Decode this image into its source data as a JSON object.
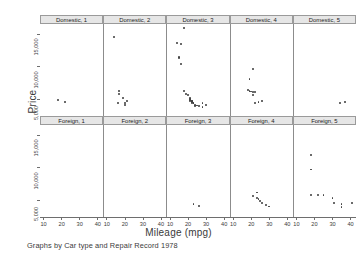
{
  "figure": {
    "ytitle": "Price",
    "xtitle": "Mileage (mpg)",
    "caption": "Graphs by Car type and Repair Record 1978"
  },
  "axes": {
    "ylabel_ticks": [
      "15,000",
      "10,000",
      "5,000"
    ],
    "yvalues": [
      15000,
      10000,
      5000
    ],
    "xlabel_ticks": [
      "10",
      "20",
      "30",
      "40"
    ],
    "xvalues": [
      10,
      20,
      30,
      40
    ],
    "ylim": [
      2500,
      16500
    ],
    "xlim": [
      8,
      43
    ]
  },
  "panels": [
    {
      "id": "domestic-1",
      "title": "Domestic, 1",
      "row": 0,
      "col": 0
    },
    {
      "id": "domestic-2",
      "title": "Domestic, 2",
      "row": 0,
      "col": 1
    },
    {
      "id": "domestic-3",
      "title": "Domestic, 3",
      "row": 0,
      "col": 2
    },
    {
      "id": "domestic-4",
      "title": "Domestic, 4",
      "row": 0,
      "col": 3
    },
    {
      "id": "domestic-5",
      "title": "Domestic, 5",
      "row": 0,
      "col": 4
    },
    {
      "id": "foreign-1",
      "title": "Foreign, 1",
      "row": 1,
      "col": 0
    },
    {
      "id": "foreign-2",
      "title": "Foreign, 2",
      "row": 1,
      "col": 1
    },
    {
      "id": "foreign-3",
      "title": "Foreign, 3",
      "row": 1,
      "col": 2
    },
    {
      "id": "foreign-4",
      "title": "Foreign, 4",
      "row": 1,
      "col": 3
    },
    {
      "id": "foreign-5",
      "title": "Foreign, 5",
      "row": 1,
      "col": 4
    }
  ],
  "chart_data": {
    "type": "scatter",
    "title": "",
    "xlabel": "Mileage (mpg)",
    "ylabel": "Price",
    "caption": "Graphs by Car type and Repair Record 1978",
    "xlim": [
      8,
      43
    ],
    "ylim": [
      2500,
      16500
    ],
    "xticks": [
      10,
      20,
      30,
      40
    ],
    "yticks": [
      5000,
      10000,
      15000
    ],
    "grid": false,
    "legend": "none",
    "facet_rows": [
      "Domestic",
      "Foreign"
    ],
    "facet_cols": [
      "1",
      "2",
      "3",
      "4",
      "5"
    ],
    "series": [
      {
        "name": "Domestic, 1",
        "points": [
          [
            18,
            4934
          ],
          [
            22,
            4589
          ]
        ]
      },
      {
        "name": "Domestic, 2",
        "points": [
          [
            14,
            14500
          ],
          [
            17,
            5788
          ],
          [
            17,
            6303
          ],
          [
            19,
            5222
          ],
          [
            21,
            4816
          ],
          [
            16,
            4452
          ],
          [
            20,
            4424
          ],
          [
            20,
            4172
          ]
        ]
      },
      {
        "name": "Domestic, 3",
        "points": [
          [
            18,
            15906
          ],
          [
            14,
            13594
          ],
          [
            16,
            13466
          ],
          [
            15,
            11497
          ],
          [
            15,
            11385
          ],
          [
            16,
            10372
          ],
          [
            18,
            6342
          ],
          [
            19,
            5799
          ],
          [
            20,
            5705
          ],
          [
            21,
            5222
          ],
          [
            21,
            5079
          ],
          [
            21,
            4989
          ],
          [
            21,
            4816
          ],
          [
            22,
            4733
          ],
          [
            22,
            4723
          ],
          [
            22,
            4589
          ],
          [
            22,
            4504
          ],
          [
            23,
            4482
          ],
          [
            23,
            4424
          ],
          [
            24,
            4172
          ],
          [
            25,
            4099
          ],
          [
            26,
            4082
          ],
          [
            28,
            4452
          ],
          [
            30,
            4187
          ],
          [
            24,
            3984
          ],
          [
            28,
            3829
          ]
        ]
      },
      {
        "name": "Domestic, 4",
        "points": [
          [
            21,
            9690
          ],
          [
            19,
            8129
          ],
          [
            18,
            6486
          ],
          [
            19,
            6295
          ],
          [
            20,
            6229
          ],
          [
            21,
            6165
          ],
          [
            22,
            6112
          ],
          [
            21,
            5705
          ],
          [
            24,
            4647
          ],
          [
            26,
            4749
          ],
          [
            22,
            4452
          ]
        ]
      },
      {
        "name": "Domestic, 5",
        "points": [
          [
            34,
            4425
          ],
          [
            37,
            4589
          ]
        ]
      },
      {
        "name": "Foreign, 1",
        "points": []
      },
      {
        "name": "Foreign, 2",
        "points": []
      },
      {
        "name": "Foreign, 3",
        "points": [
          [
            23,
            4499
          ],
          [
            26,
            4187
          ]
        ]
      },
      {
        "name": "Foreign, 4",
        "points": [
          [
            23,
            6229
          ],
          [
            21,
            5719
          ],
          [
            23,
            5379
          ],
          [
            24,
            5189
          ],
          [
            25,
            4890
          ],
          [
            26,
            4697
          ],
          [
            28,
            4296
          ],
          [
            30,
            4099
          ]
        ]
      },
      {
        "name": "Foreign, 5",
        "points": [
          [
            18,
            11995
          ],
          [
            18,
            9735
          ],
          [
            18,
            5899
          ],
          [
            22,
            5799
          ],
          [
            30,
            5397
          ],
          [
            31,
            4697
          ],
          [
            35,
            4425
          ],
          [
            35,
            3995
          ],
          [
            41,
            4589
          ],
          [
            25,
            5899
          ]
        ]
      }
    ]
  }
}
